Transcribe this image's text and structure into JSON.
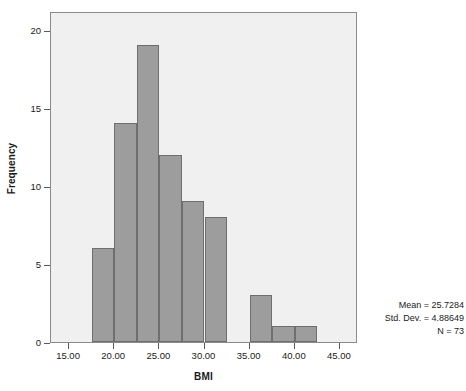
{
  "chart_data": {
    "type": "bar",
    "title": "",
    "subtitle": "",
    "xlabel": "BMI",
    "ylabel": "Frequency",
    "xlim": [
      13.0,
      47.0
    ],
    "ylim": [
      0,
      21.2
    ],
    "grid": false,
    "legend": null,
    "bin_width": 2.5,
    "bins": [
      {
        "left": 17.5,
        "right": 20.0,
        "value": 6
      },
      {
        "left": 20.0,
        "right": 22.5,
        "value": 14
      },
      {
        "left": 22.5,
        "right": 25.0,
        "value": 19
      },
      {
        "left": 25.0,
        "right": 27.5,
        "value": 12
      },
      {
        "left": 27.5,
        "right": 30.0,
        "value": 9
      },
      {
        "left": 30.0,
        "right": 32.5,
        "value": 8
      },
      {
        "left": 35.0,
        "right": 37.5,
        "value": 3
      },
      {
        "left": 37.5,
        "right": 40.0,
        "value": 1
      },
      {
        "left": 40.0,
        "right": 42.5,
        "value": 1
      }
    ],
    "categories": [
      "17.5-20.0",
      "20.0-22.5",
      "22.5-25.0",
      "25.0-27.5",
      "27.5-30.0",
      "30.0-32.5",
      "35.0-37.5",
      "37.5-40.0",
      "40.0-42.5"
    ],
    "values": [
      6,
      14,
      19,
      12,
      9,
      8,
      3,
      1,
      1
    ],
    "x_ticks": [
      "15.00",
      "20.00",
      "25.00",
      "30.00",
      "35.00",
      "40.00",
      "45.00"
    ],
    "x_tick_values": [
      15,
      20,
      25,
      30,
      35,
      40,
      45
    ],
    "y_ticks": [
      "0",
      "5",
      "10",
      "15",
      "20"
    ],
    "y_tick_values": [
      0,
      5,
      10,
      15,
      20
    ],
    "annotations": [
      "Mean = 25.7284",
      "Std. Dev. = 4.88649",
      "N = 73"
    ]
  },
  "stats": {
    "mean": "Mean = 25.7284",
    "std_dev": "Std. Dev. = 4.88649",
    "n": "N = 73"
  },
  "colors": {
    "bar_fill": "#9d9d9d",
    "bar_border": "#6e6e6e",
    "plot_background": "#f0f0f0",
    "frame_border": "#8a8a8a",
    "text": "#1a1a1a"
  }
}
